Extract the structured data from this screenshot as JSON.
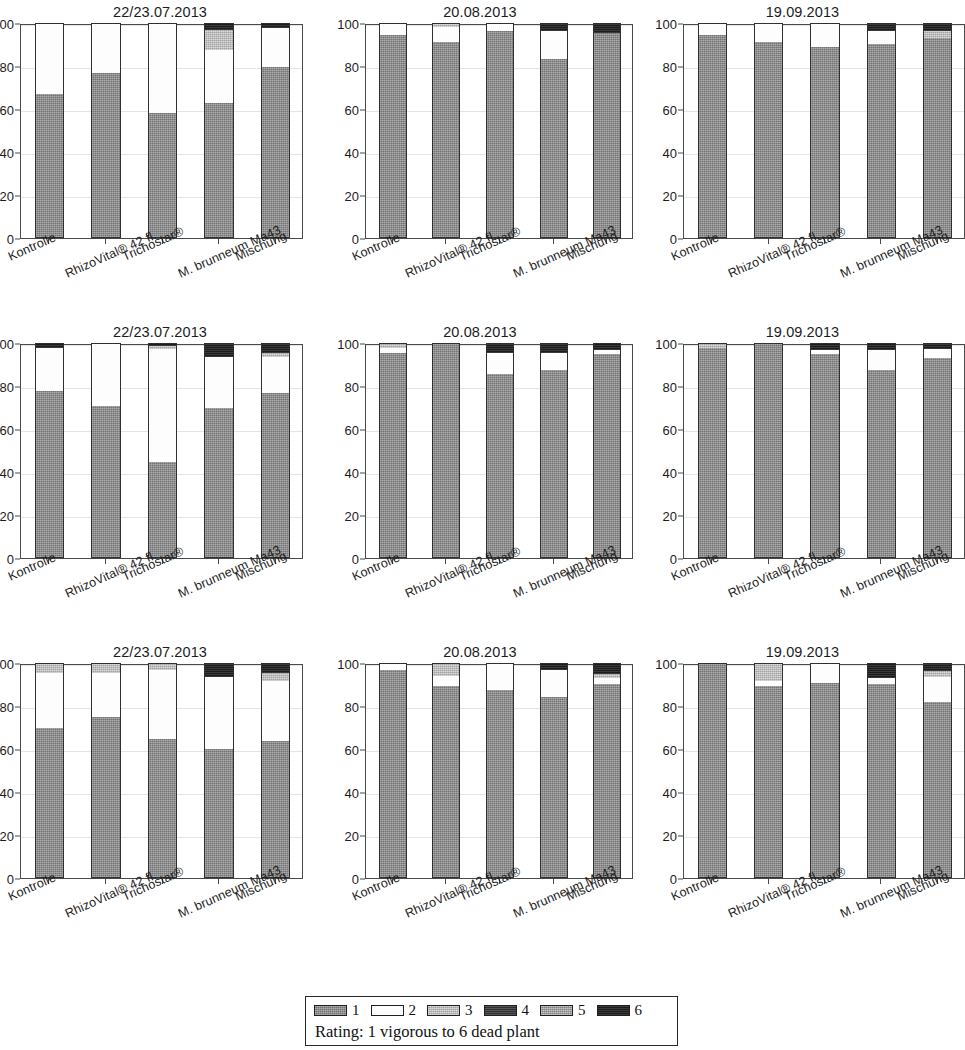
{
  "figure": {
    "rating_scale_caption": "Rating: 1 vigorous to 6 dead plant"
  },
  "legend": {
    "items": [
      {
        "label": "1",
        "color": "#8d8d8d"
      },
      {
        "label": "2",
        "color": "#fdfdfd"
      },
      {
        "label": "3",
        "color": "#bdbdbd"
      },
      {
        "label": "4",
        "color": "#3a3a3a"
      },
      {
        "label": "5",
        "color": "#a6a6a6"
      },
      {
        "label": "6",
        "color": "#242424"
      }
    ],
    "caption": "Rating: 1 vigorous to 6 dead plant"
  },
  "axis": {
    "yticks": [
      "100",
      "80",
      "60",
      "40",
      "20",
      "0"
    ],
    "ytick_values": [
      100,
      80,
      60,
      40,
      20,
      0
    ],
    "ylim": [
      0,
      100
    ],
    "categories": [
      "Kontrolle",
      "RhizoVital® 42 fl.",
      "Trichostar®",
      "M. brunneum Ma43",
      "Mischung"
    ]
  },
  "chart_data": [
    {
      "type": "bar",
      "title": "22/23.07.2013",
      "panel": "row1-col1",
      "xlabel": "",
      "ylabel": "",
      "ylim": [
        0,
        100
      ],
      "grid": true,
      "legend_position": "bottom",
      "stacked": true,
      "categories": [
        "Kontrolle",
        "RhizoVital® 42 fl.",
        "Trichostar®",
        "M. brunneum Ma43",
        "Mischung"
      ],
      "series": [
        {
          "name": "1",
          "values": [
            67,
            77,
            58,
            63,
            80
          ]
        },
        {
          "name": "2",
          "values": [
            33,
            23,
            42,
            25,
            18
          ]
        },
        {
          "name": "3",
          "values": [
            0,
            0,
            0,
            9,
            0
          ]
        },
        {
          "name": "4",
          "values": [
            0,
            0,
            0,
            0,
            0
          ]
        },
        {
          "name": "5",
          "values": [
            0,
            0,
            0,
            0,
            0
          ]
        },
        {
          "name": "6",
          "values": [
            0,
            0,
            0,
            3,
            2
          ]
        }
      ]
    },
    {
      "type": "bar",
      "title": "20.08.2013",
      "panel": "row1-col2",
      "xlabel": "",
      "ylabel": "",
      "ylim": [
        0,
        100
      ],
      "grid": true,
      "legend_position": "bottom",
      "stacked": true,
      "categories": [
        "Kontrolle",
        "RhizoVital® 42 fl.",
        "Trichostar®",
        "M. brunneum Ma43",
        "Mischung"
      ],
      "series": [
        {
          "name": "1",
          "values": [
            95,
            91.5,
            96.5,
            83.5,
            96
          ]
        },
        {
          "name": "2",
          "values": [
            5,
            7,
            3.5,
            13,
            0
          ]
        },
        {
          "name": "3",
          "values": [
            0,
            1.5,
            0,
            0,
            0
          ]
        },
        {
          "name": "4",
          "values": [
            0,
            0,
            0,
            0,
            0
          ]
        },
        {
          "name": "5",
          "values": [
            0,
            0,
            0,
            0,
            0
          ]
        },
        {
          "name": "6",
          "values": [
            0,
            0,
            0,
            3.5,
            4
          ]
        }
      ]
    },
    {
      "type": "bar",
      "title": "19.09.2013",
      "panel": "row1-col3",
      "xlabel": "",
      "ylabel": "",
      "ylim": [
        0,
        100
      ],
      "grid": true,
      "legend_position": "bottom",
      "stacked": true,
      "categories": [
        "Kontrolle",
        "RhizoVital® 42 fl.",
        "Trichostar®",
        "M. brunneum Ma43",
        "Mischung"
      ],
      "series": [
        {
          "name": "1",
          "values": [
            95,
            91.5,
            89,
            90.5,
            93.5
          ]
        },
        {
          "name": "2",
          "values": [
            5,
            8.5,
            11,
            6,
            0
          ]
        },
        {
          "name": "3",
          "values": [
            0,
            0,
            0,
            0,
            3
          ]
        },
        {
          "name": "4",
          "values": [
            0,
            0,
            0,
            0,
            0
          ]
        },
        {
          "name": "5",
          "values": [
            0,
            0,
            0,
            0,
            0
          ]
        },
        {
          "name": "6",
          "values": [
            0,
            0,
            0,
            3.5,
            3.5
          ]
        }
      ]
    },
    {
      "type": "bar",
      "title": "22/23.07.2013",
      "panel": "row2-col1",
      "xlabel": "",
      "ylabel": "",
      "ylim": [
        0,
        100
      ],
      "grid": true,
      "legend_position": "bottom",
      "stacked": true,
      "categories": [
        "Kontrolle",
        "RhizoVital® 42 fl.",
        "Trichostar®",
        "M. brunneum Ma43",
        "Mischung"
      ],
      "series": [
        {
          "name": "1",
          "values": [
            78,
            71,
            44.5,
            70,
            77
          ]
        },
        {
          "name": "2",
          "values": [
            20,
            29,
            53,
            24,
            17
          ]
        },
        {
          "name": "3",
          "values": [
            0,
            0,
            1.5,
            0,
            2
          ]
        },
        {
          "name": "4",
          "values": [
            0,
            0,
            0,
            0,
            0
          ]
        },
        {
          "name": "5",
          "values": [
            0,
            0,
            0,
            0,
            0
          ]
        },
        {
          "name": "6",
          "values": [
            2,
            0,
            1,
            6,
            4
          ]
        }
      ]
    },
    {
      "type": "bar",
      "title": "20.08.2013",
      "panel": "row2-col2",
      "xlabel": "",
      "ylabel": "",
      "ylim": [
        0,
        100
      ],
      "grid": true,
      "legend_position": "bottom",
      "stacked": true,
      "categories": [
        "Kontrolle",
        "RhizoVital® 42 fl.",
        "Trichostar®",
        "M. brunneum Ma43",
        "Mischung"
      ],
      "series": [
        {
          "name": "1",
          "values": [
            96,
            100,
            86,
            88,
            95.5
          ]
        },
        {
          "name": "2",
          "values": [
            2,
            0,
            10,
            8,
            1.5
          ]
        },
        {
          "name": "3",
          "values": [
            2,
            0,
            0,
            0,
            0
          ]
        },
        {
          "name": "4",
          "values": [
            0,
            0,
            0,
            0,
            0
          ]
        },
        {
          "name": "5",
          "values": [
            0,
            0,
            0,
            0,
            0
          ]
        },
        {
          "name": "6",
          "values": [
            0,
            0,
            4,
            4,
            3
          ]
        }
      ]
    },
    {
      "type": "bar",
      "title": "19.09.2013",
      "panel": "row2-col3",
      "xlabel": "",
      "ylabel": "",
      "ylim": [
        0,
        100
      ],
      "grid": true,
      "legend_position": "bottom",
      "stacked": true,
      "categories": [
        "Kontrolle",
        "RhizoVital® 42 fl.",
        "Trichostar®",
        "M. brunneum Ma43",
        "Mischung"
      ],
      "series": [
        {
          "name": "1",
          "values": [
            98,
            100,
            95.5,
            88,
            93.5
          ]
        },
        {
          "name": "2",
          "values": [
            0,
            0,
            1.5,
            9,
            4
          ]
        },
        {
          "name": "3",
          "values": [
            2,
            0,
            0,
            0,
            0
          ]
        },
        {
          "name": "4",
          "values": [
            0,
            0,
            0,
            0,
            0
          ]
        },
        {
          "name": "5",
          "values": [
            0,
            0,
            0,
            0,
            0
          ]
        },
        {
          "name": "6",
          "values": [
            0,
            0,
            3,
            3,
            2.5
          ]
        }
      ]
    },
    {
      "type": "bar",
      "title": "22/23.07.2013",
      "panel": "row3-col1",
      "xlabel": "",
      "ylabel": "",
      "ylim": [
        0,
        100
      ],
      "grid": true,
      "legend_position": "bottom",
      "stacked": true,
      "categories": [
        "Kontrolle",
        "RhizoVital® 42 fl.",
        "Trichostar®",
        "M. brunneum Ma43",
        "Mischung"
      ],
      "series": [
        {
          "name": "1",
          "values": [
            70,
            75,
            65,
            60,
            64
          ]
        },
        {
          "name": "2",
          "values": [
            26,
            21,
            32,
            34,
            28
          ]
        },
        {
          "name": "3",
          "values": [
            4,
            4,
            3,
            0,
            4
          ]
        },
        {
          "name": "4",
          "values": [
            0,
            0,
            0,
            0,
            0
          ]
        },
        {
          "name": "5",
          "values": [
            0,
            0,
            0,
            0,
            0
          ]
        },
        {
          "name": "6",
          "values": [
            0,
            0,
            0,
            6,
            4
          ]
        }
      ]
    },
    {
      "type": "bar",
      "title": "20.08.2013",
      "panel": "row3-col2",
      "xlabel": "",
      "ylabel": "",
      "ylim": [
        0,
        100
      ],
      "grid": true,
      "legend_position": "bottom",
      "stacked": true,
      "categories": [
        "Kontrolle",
        "RhizoVital® 42 fl.",
        "Trichostar®",
        "M. brunneum Ma43",
        "Mischung"
      ],
      "series": [
        {
          "name": "1",
          "values": [
            97,
            89.5,
            88,
            84.5,
            90.5
          ]
        },
        {
          "name": "2",
          "values": [
            3,
            5,
            12,
            12.5,
            3
          ]
        },
        {
          "name": "3",
          "values": [
            0,
            5.5,
            0,
            0,
            2
          ]
        },
        {
          "name": "4",
          "values": [
            0,
            0,
            0,
            0,
            0
          ]
        },
        {
          "name": "5",
          "values": [
            0,
            0,
            0,
            0,
            0
          ]
        },
        {
          "name": "6",
          "values": [
            0,
            0,
            0,
            3,
            4.5
          ]
        }
      ]
    },
    {
      "type": "bar",
      "title": "19.09.2013",
      "panel": "row3-col3",
      "xlabel": "",
      "ylabel": "",
      "ylim": [
        0,
        100
      ],
      "grid": true,
      "legend_position": "bottom",
      "stacked": true,
      "categories": [
        "Kontrolle",
        "RhizoVital® 42 fl.",
        "Trichostar®",
        "M. brunneum Ma43",
        "Mischung"
      ],
      "series": [
        {
          "name": "1",
          "values": [
            100,
            89.5,
            91,
            90.5,
            82
          ]
        },
        {
          "name": "2",
          "values": [
            0,
            2.5,
            9,
            3,
            12
          ]
        },
        {
          "name": "3",
          "values": [
            0,
            8,
            0,
            0,
            2.5
          ]
        },
        {
          "name": "4",
          "values": [
            0,
            0,
            0,
            0,
            0
          ]
        },
        {
          "name": "5",
          "values": [
            0,
            0,
            0,
            0,
            0
          ]
        },
        {
          "name": "6",
          "values": [
            0,
            0,
            0,
            6.5,
            3.5
          ]
        }
      ]
    }
  ]
}
